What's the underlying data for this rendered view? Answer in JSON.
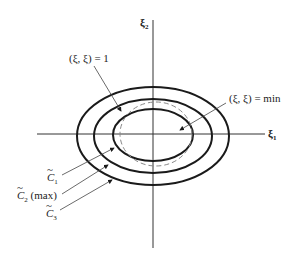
{
  "diagram": {
    "axes": {
      "x_label": "ξ",
      "x_sub": "1",
      "y_label": "ξ",
      "y_sub": "2"
    },
    "annotations": {
      "unit_circle": "(ξ, ξ) = 1",
      "min_label": "(ξ, ξ) = min"
    },
    "curves": [
      {
        "name": "C",
        "sub": "1",
        "suffix": ""
      },
      {
        "name": "C",
        "sub": "2",
        "suffix": " (max)"
      },
      {
        "name": "C",
        "sub": "3",
        "suffix": ""
      }
    ],
    "colors": {
      "stroke": "#1a1a1a",
      "dashed": "#888888"
    }
  }
}
